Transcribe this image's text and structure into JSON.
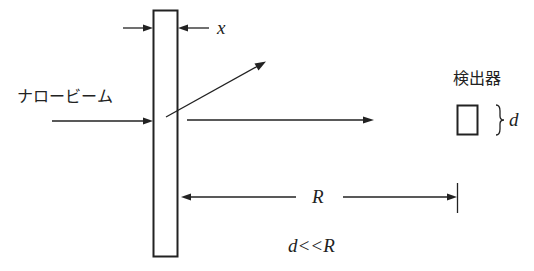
{
  "diagram": {
    "type": "narrow-beam attenuation setup",
    "labels": {
      "beam": "ナロービーム",
      "detector": "検出器",
      "thickness": "x",
      "detector_size": "d",
      "distance": "R",
      "condition": "d<<R"
    },
    "elements": [
      {
        "name": "absorber-slab",
        "description": "vertical rectangle of thickness x"
      },
      {
        "name": "incident-beam",
        "description": "horizontal arrow from left to slab"
      },
      {
        "name": "scattered-ray",
        "description": "diagonal arrow leaving slab upward-right"
      },
      {
        "name": "transmitted-beam",
        "description": "horizontal arrow to the right of slab"
      },
      {
        "name": "detector",
        "description": "small square of size d"
      },
      {
        "name": "distance-dimension",
        "description": "double arrow R from slab to detector plane"
      }
    ]
  }
}
